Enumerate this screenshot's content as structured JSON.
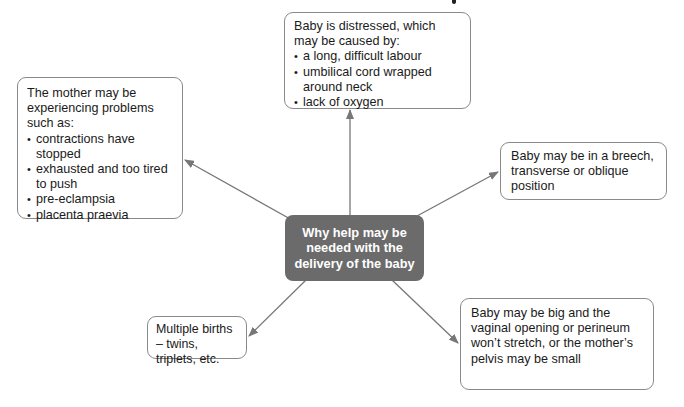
{
  "diagram": {
    "center": {
      "title": "Why help may be needed with the delivery of the baby",
      "lines": [
        "Why help may be",
        "needed with the",
        "delivery of the baby"
      ],
      "fill": "#6b6b6b",
      "text_color": "#ffffff"
    },
    "nodes": {
      "top": {
        "intro": "Baby is distressed, which may be caused by:",
        "bullets": [
          "a long, difficult labour",
          "umbilical cord wrapped around neck",
          "lack of oxygen"
        ]
      },
      "left": {
        "intro": "The mother may be experiencing problems such as:",
        "bullets": [
          "contractions have stopped",
          "exhausted and too tired to push",
          "pre-eclampsia",
          "placenta praevia"
        ]
      },
      "right": {
        "text": "Baby may be in a breech, transverse or oblique position"
      },
      "bottom_left": {
        "text": "Multiple births – twins, triplets, etc."
      },
      "bottom_right": {
        "text": "Baby may be big and the vaginal opening or perineum won’t stretch, or the mother’s pelvis may be small"
      }
    },
    "edges": [
      {
        "from": "center",
        "to": "top"
      },
      {
        "from": "center",
        "to": "left"
      },
      {
        "from": "center",
        "to": "right"
      },
      {
        "from": "center",
        "to": "bottom_left"
      },
      {
        "from": "center",
        "to": "bottom_right"
      }
    ],
    "colors": {
      "arrow": "#777777",
      "box_border": "#8a8a8a"
    }
  }
}
